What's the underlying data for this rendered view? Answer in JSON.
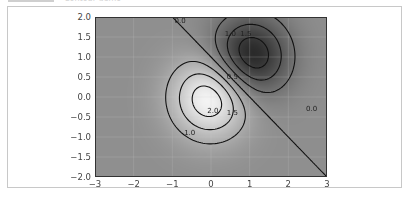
{
  "header": {
    "tab_label": "",
    "faded_text": "Contour demo"
  },
  "chart_data": {
    "type": "contour",
    "title": "",
    "xlabel": "",
    "ylabel": "",
    "xlim": [
      -3,
      3
    ],
    "ylim": [
      -2,
      2
    ],
    "x_ticks": [
      "−3",
      "−2",
      "−1",
      "0",
      "1",
      "2",
      "3"
    ],
    "y_ticks": [
      "2.0",
      "1.5",
      "1.0",
      "0.5",
      "0.0",
      "−0.5",
      "−1.0",
      "−1.5",
      "−2.0"
    ],
    "function": "Z = 2*(exp(-x^2 - y^2) - exp(-(x-1)^2 - (y-1)^2))",
    "levels": [
      -1.5,
      -1.0,
      -0.5,
      0.0,
      0.5,
      1.0,
      1.5,
      2.0
    ],
    "negative_linestyle": "dashed",
    "colormap": "gray",
    "contour_labels": [
      "0.0",
      "0.5",
      "1.0",
      "1.5",
      "2.0",
      "−1.0",
      "−1.5",
      "0.0"
    ],
    "peaks": [
      {
        "x": 0,
        "y": 0,
        "value": 2.0,
        "type": "max"
      },
      {
        "x": 1,
        "y": 1,
        "value": -2.0,
        "type": "min"
      }
    ],
    "grid": true
  }
}
